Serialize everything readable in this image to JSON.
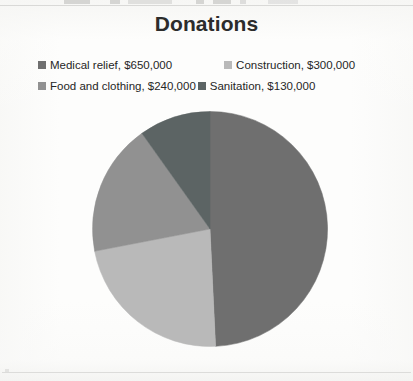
{
  "chart_data": {
    "type": "pie",
    "title": "Donations",
    "categories": [
      "Medical relief",
      "Construction",
      "Food and clothing",
      "Sanitation"
    ],
    "values": [
      650000,
      300000,
      240000,
      130000
    ],
    "value_labels": [
      "$650,000",
      "$300,000",
      "$240,000",
      "$130,000"
    ],
    "legend_entries": [
      "Medical relief, $650,000",
      "Construction, $300,000",
      "Food and clothing, $240,000",
      "Sanitation, $130,000"
    ],
    "colors": [
      "#6f6f6f",
      "#b9b9b9",
      "#919191",
      "#5c6464"
    ],
    "total": 1320000,
    "percentages": [
      49.24,
      22.73,
      18.18,
      9.85
    ],
    "start_angle_deg": 0,
    "direction": "clockwise",
    "legend_position": "top",
    "grid": false,
    "xlabel": "",
    "ylabel": "",
    "data_labels_shown": false
  },
  "chart": {
    "title": "Donations",
    "legend": {
      "rows": [
        [
          {
            "label": "Medical relief, $650,000",
            "color": "#6f6f6f",
            "name": "legend-item-medical-relief"
          },
          {
            "label": "Construction, $300,000",
            "color": "#b9b9b9",
            "name": "legend-item-construction"
          }
        ],
        [
          {
            "label": "Food and clothing, $240,000",
            "color": "#919191",
            "name": "legend-item-food-and-clothing"
          },
          {
            "label": "Sanitation, $130,000",
            "color": "#5c6464",
            "name": "legend-item-sanitation"
          }
        ]
      ]
    },
    "slices": [
      {
        "name": "Medical relief",
        "value": 650000,
        "label": "$650,000",
        "color": "#6f6f6f",
        "start_deg": 0.0,
        "sweep_deg": 177.27
      },
      {
        "name": "Construction",
        "value": 300000,
        "label": "$300,000",
        "color": "#b9b9b9",
        "start_deg": 177.27,
        "sweep_deg": 81.82
      },
      {
        "name": "Food and clothing",
        "value": 240000,
        "label": "$240,000",
        "color": "#919191",
        "start_deg": 259.09,
        "sweep_deg": 65.45
      },
      {
        "name": "Sanitation",
        "value": 130000,
        "label": "$130,000",
        "color": "#5c6464",
        "start_deg": 324.55,
        "sweep_deg": 35.45
      }
    ]
  }
}
